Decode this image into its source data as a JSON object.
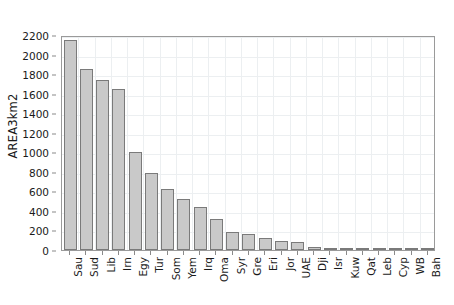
{
  "chart_data": {
    "type": "bar",
    "title": "",
    "xlabel": "",
    "ylabel": "AREA3km2",
    "ylim": [
      0,
      2200
    ],
    "ytick_step": 200,
    "yticks": [
      0,
      200,
      400,
      600,
      800,
      1000,
      1200,
      1400,
      1600,
      1800,
      2000,
      2200
    ],
    "grid": true,
    "legend": "none",
    "bar_fill_color": "#c9c9c9",
    "bar_edge_color": "#7a7a7a",
    "categories": [
      "Sau",
      "Sud",
      "Lib",
      "Irn",
      "Egy",
      "Tur",
      "Som",
      "Yem",
      "Irq",
      "Oma",
      "Syr",
      "Gre",
      "Eri",
      "Jor",
      "UAE",
      "Dji",
      "Isr",
      "Kuw",
      "Qat",
      "Leb",
      "Cyp",
      "WB",
      "Bah"
    ],
    "values": [
      2150,
      1850,
      1740,
      1650,
      1000,
      790,
      620,
      520,
      440,
      320,
      180,
      160,
      125,
      92,
      84,
      26,
      22,
      18,
      13,
      11,
      9,
      6,
      2
    ]
  }
}
